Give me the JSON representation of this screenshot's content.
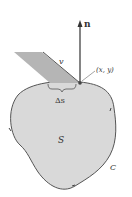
{
  "labels": {
    "normal": "n",
    "velocity": "v",
    "point": "(x, y)",
    "arc": "Δs",
    "region": "S",
    "curve": "C"
  },
  "colors": {
    "region_fill": "#d9d9d9",
    "outline": "#555555",
    "strip_fill": "#b5b5b5"
  }
}
